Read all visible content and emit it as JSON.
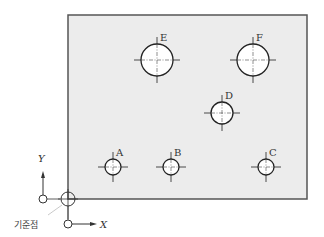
{
  "plate": {
    "x": 68,
    "y": 15,
    "width": 239,
    "height": 184,
    "fill": "#ececec",
    "stroke": "#555555"
  },
  "holes": [
    {
      "label": "A",
      "cx": 113,
      "cy": 167,
      "r": 8
    },
    {
      "label": "B",
      "cx": 171,
      "cy": 167,
      "r": 8
    },
    {
      "label": "C",
      "cx": 266,
      "cy": 167,
      "r": 8
    },
    {
      "label": "D",
      "cx": 222,
      "cy": 113,
      "r": 11
    },
    {
      "label": "E",
      "cx": 157,
      "cy": 60,
      "r": 16
    },
    {
      "label": "F",
      "cx": 253,
      "cy": 60,
      "r": 16
    }
  ],
  "axes": {
    "x_label": "X",
    "y_label": "Y"
  },
  "origin": {
    "label": "기준점"
  }
}
